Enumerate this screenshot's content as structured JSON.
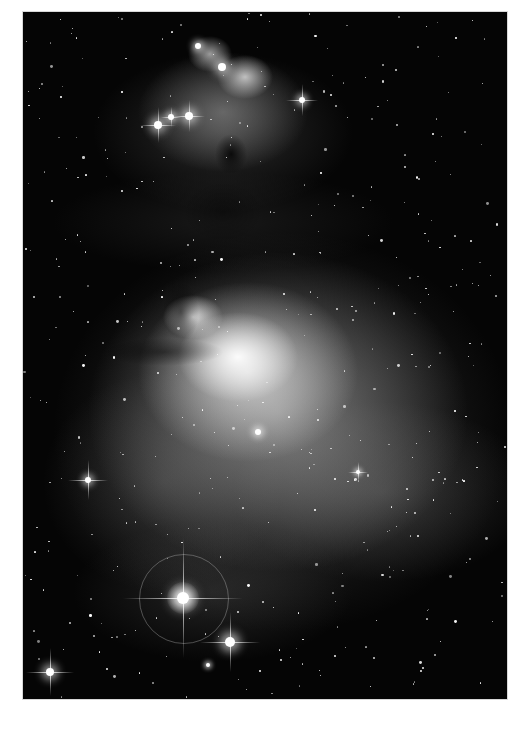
{
  "image": {
    "subject": "Orion Nebula (M42) and De Mairan's / M43 region with Running Man Nebula above, grayscale astrophotograph",
    "palette": {
      "border": "#ffffff",
      "sky": "#050505",
      "nebula_core": "#f5f5f5",
      "nebula_mid": "#9a9a9a"
    },
    "frame": {
      "x": 23,
      "y": 12,
      "width": 484,
      "height": 687
    },
    "bright_stars": [
      {
        "name": "star-halo-bottom",
        "x": 183,
        "y": 598,
        "r": 6,
        "spikes": 60,
        "halo": 44
      },
      {
        "name": "star-bottom-right",
        "x": 230,
        "y": 642,
        "r": 5,
        "spikes": 30
      },
      {
        "name": "star-bottom-left",
        "x": 50,
        "y": 672,
        "r": 4,
        "spikes": 24
      },
      {
        "name": "star-left-mid",
        "x": 88,
        "y": 480,
        "r": 3,
        "spikes": 20
      },
      {
        "name": "star-top-right",
        "x": 302,
        "y": 100,
        "r": 3,
        "spikes": 16
      },
      {
        "name": "star-top-cluster-a",
        "x": 158,
        "y": 125,
        "r": 4,
        "spikes": 18
      },
      {
        "name": "star-top-cluster-b",
        "x": 189,
        "y": 116,
        "r": 4,
        "spikes": 16
      },
      {
        "name": "star-top-cluster-c",
        "x": 171,
        "y": 117,
        "r": 3,
        "spikes": 10
      },
      {
        "name": "star-trapezium",
        "x": 258,
        "y": 432,
        "r": 3,
        "spikes": 0
      },
      {
        "name": "star-top-a",
        "x": 222,
        "y": 67,
        "r": 4,
        "spikes": 0
      },
      {
        "name": "star-top-b",
        "x": 198,
        "y": 46,
        "r": 3,
        "spikes": 0
      },
      {
        "name": "star-right-mid",
        "x": 358,
        "y": 472,
        "r": 2,
        "spikes": 10
      },
      {
        "name": "star-bottom-small",
        "x": 208,
        "y": 665,
        "r": 2,
        "spikes": 0
      }
    ],
    "starfield": {
      "count": 420,
      "seed": 7
    }
  }
}
